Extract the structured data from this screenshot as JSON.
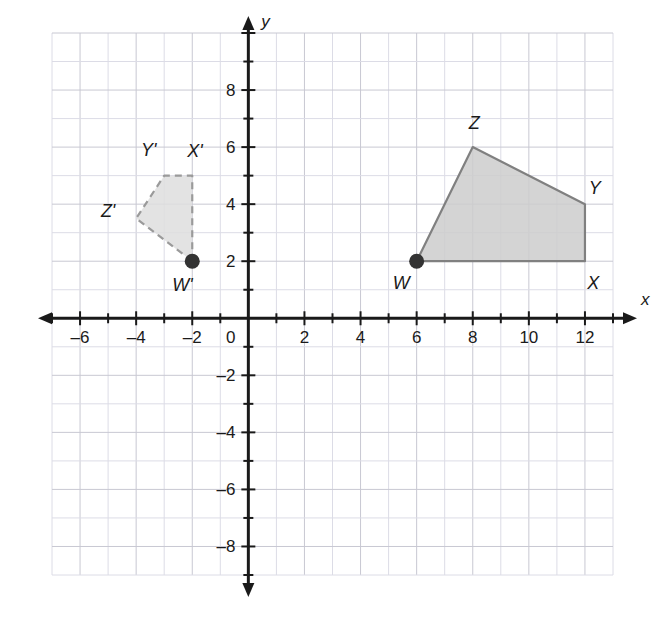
{
  "figure": {
    "background_color": "#ffffff",
    "grid_color": "#c8c8d2",
    "grid_minor_color": "#dcdce6",
    "axis_color": "#1a1a1a"
  },
  "axes": {
    "x": {
      "name": "x",
      "min": -7,
      "max": 13,
      "tick_step": 2,
      "tick_labels": [
        "-6",
        "-4",
        "-2",
        "2",
        "4",
        "6",
        "8",
        "10",
        "12"
      ],
      "tick_values": [
        -6,
        -4,
        -2,
        2,
        4,
        6,
        8,
        10,
        12
      ]
    },
    "y": {
      "name": "y",
      "min": -9,
      "max": 10,
      "tick_step": 2,
      "tick_labels": [
        "8",
        "6",
        "4",
        "2",
        "-2",
        "-4",
        "-6",
        "-8"
      ],
      "tick_values": [
        8,
        6,
        4,
        2,
        -2,
        -4,
        -6,
        -8
      ]
    },
    "origin_label": "0"
  },
  "chart_data": {
    "type": "scatter",
    "xlabel": "x",
    "ylabel": "y",
    "xlim": [
      -7,
      13
    ],
    "ylim": [
      -9,
      10
    ],
    "grid": true,
    "legend": "none",
    "series": [
      {
        "name": "WXYZ",
        "type": "polygon",
        "style": "solid",
        "fill": "#cccccc",
        "stroke": "#808080",
        "vertices": [
          {
            "label": "W",
            "x": 6,
            "y": 2,
            "label_dx": -0.55,
            "label_dy": -0.75,
            "marker": "filled-dot"
          },
          {
            "label": "X",
            "x": 12,
            "y": 2,
            "label_dx": 0.3,
            "label_dy": -0.75,
            "marker": "none"
          },
          {
            "label": "Y",
            "x": 12,
            "y": 4,
            "label_dx": 0.35,
            "label_dy": 0.55,
            "marker": "none"
          },
          {
            "label": "Z",
            "x": 8,
            "y": 6,
            "label_dx": 0.05,
            "label_dy": 0.85,
            "marker": "none"
          }
        ]
      },
      {
        "name": "W'X'Y'Z'",
        "type": "polygon",
        "style": "dashed",
        "fill": "#dedede",
        "stroke": "#9a9a9a",
        "vertices": [
          {
            "label": "W'",
            "x": -2,
            "y": 2,
            "label_dx": -0.35,
            "label_dy": -0.85,
            "marker": "filled-dot"
          },
          {
            "label": "X'",
            "x": -2,
            "y": 5,
            "label_dx": 0.1,
            "label_dy": 0.85,
            "marker": "none"
          },
          {
            "label": "Y'",
            "x": -3,
            "y": 5,
            "label_dx": -0.55,
            "label_dy": 0.9,
            "marker": "none"
          },
          {
            "label": "Z'",
            "x": -4,
            "y": 3.5,
            "label_dx": -1.0,
            "label_dy": 0.25,
            "marker": "none"
          }
        ]
      }
    ]
  }
}
